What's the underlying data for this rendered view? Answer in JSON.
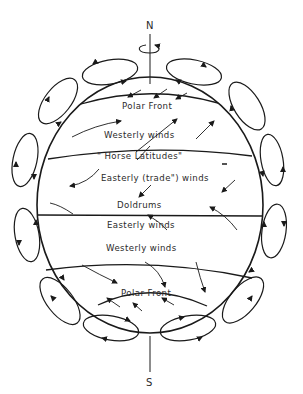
{
  "diagram": {
    "type": "global-atmospheric-circulation",
    "poles": {
      "north": "N",
      "south": "S"
    },
    "rotation_indicator": "rotation-arrow-icon",
    "zones": [
      {
        "id": "polar-front-north",
        "label": "Polar Front"
      },
      {
        "id": "westerlies-north",
        "label": "Westerly winds"
      },
      {
        "id": "horse-latitudes-north",
        "label": "\" Horse Latitudes\""
      },
      {
        "id": "trade-winds-north",
        "label": "Easterly (trade\") winds"
      },
      {
        "id": "doldrums",
        "label": "Doldrums"
      },
      {
        "id": "easterlies-south",
        "label": "Easterly  winds"
      },
      {
        "id": "westerlies-south",
        "label": "Westerly winds"
      },
      {
        "id": "polar-front-south",
        "label": "Polar Front"
      }
    ],
    "circulation_cells": 12,
    "colors": {
      "line": "#1a1a1a",
      "text": "#2a2a2a",
      "background": "#ffffff"
    }
  }
}
